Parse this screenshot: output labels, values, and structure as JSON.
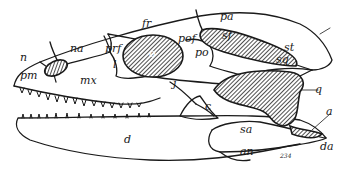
{
  "figure": {
    "labels": {
      "n": "n",
      "na": "na",
      "pm": "pm",
      "mx": "mx",
      "prf": "prf",
      "l": "l",
      "o": "o",
      "fr": "fr",
      "pof": "pof",
      "po": "po",
      "j": "j",
      "pa": "pa",
      "sf": "sf",
      "st": "st",
      "sq": "sq",
      "q": "q",
      "c": "c",
      "sa": "sa",
      "a": "a",
      "d": "d",
      "an": "an",
      "da": "da",
      "fig_no": "234"
    }
  }
}
